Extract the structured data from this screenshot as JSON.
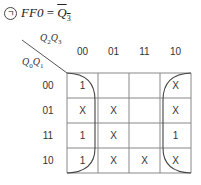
{
  "title": {
    "marker": "ㄱ",
    "lhs": "FF0",
    "equals": " = ",
    "rhs_var": "Q",
    "rhs_sub": "3",
    "rhs_complemented": true
  },
  "axis_labels": {
    "col_var1": "Q",
    "col_sub1": "2",
    "col_var2": "Q",
    "col_sub2": "3",
    "row_var1": "Q",
    "row_sub1": "0",
    "row_var2": "Q",
    "row_sub2": "1"
  },
  "columns": [
    "00",
    "01",
    "11",
    "10"
  ],
  "rows": [
    "00",
    "01",
    "11",
    "10"
  ],
  "cells": [
    [
      "1",
      "",
      "",
      "X"
    ],
    [
      "X",
      "X",
      "",
      "X"
    ],
    [
      "1",
      "X",
      "",
      "1"
    ],
    [
      "1",
      "X",
      "X",
      "X"
    ]
  ],
  "grouping": "corner/edge wrap group covering columns 00 and 10 (Q3 = 0)"
}
